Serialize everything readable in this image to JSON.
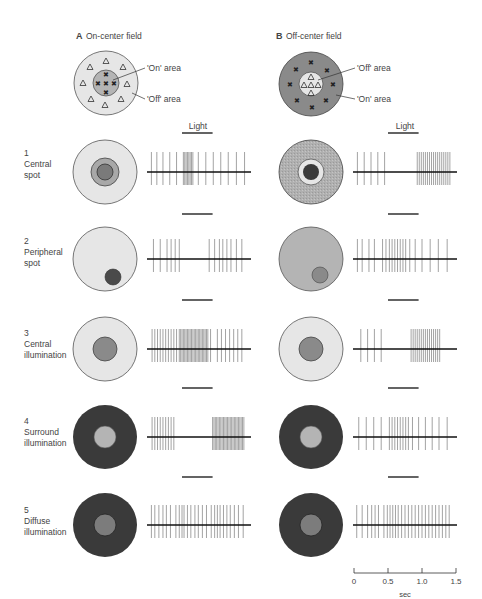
{
  "panels": {
    "A": {
      "letter": "A",
      "title": "On-center field",
      "center_label": "'On' area",
      "surround_label": "'Off' area",
      "center_symbol": "x",
      "surround_symbol": "triangle"
    },
    "B": {
      "letter": "B",
      "title": "Off-center field",
      "center_label": "'Off' area",
      "surround_label": "'On' area",
      "center_symbol": "triangle",
      "surround_symbol": "x"
    }
  },
  "light_label": "Light",
  "conditions": [
    {
      "num": "1",
      "line1": "Central",
      "line2": "spot"
    },
    {
      "num": "2",
      "line1": "Peripheral",
      "line2": "spot"
    },
    {
      "num": "3",
      "line1": "Central",
      "line2": "illumination"
    },
    {
      "num": "4",
      "line1": "Surround",
      "line2": "illumination"
    },
    {
      "num": "5",
      "line1": "Diffuse",
      "line2": "illumination"
    }
  ],
  "time_axis": {
    "ticks": [
      "0",
      "0.5",
      "1.0",
      "1.5"
    ],
    "label": "sec"
  },
  "colors": {
    "light_gray": "#e6e6e6",
    "mid_gray": "#b4b4b4",
    "dark_gray": "#8a8a8a",
    "dark": "#3a3a3a",
    "spot_dark": "#4a4a4a",
    "outline": "#555555",
    "spike": "#8c8c8c",
    "baseline": "#111111"
  },
  "spike_trains": {
    "A": [
      [
        0.05,
        0.13,
        0.22,
        0.32,
        0.42,
        0.52,
        0.54,
        0.56,
        0.58,
        0.6,
        0.62,
        0.64,
        0.66,
        0.74,
        0.85,
        0.96,
        1.07,
        1.18,
        1.3,
        1.42
      ],
      [
        0.08,
        0.18,
        0.28,
        0.34,
        0.4,
        0.46,
        0.9,
        0.98,
        1.05,
        1.1,
        1.16,
        1.22,
        1.3,
        1.38
      ],
      [
        0.06,
        0.1,
        0.14,
        0.18,
        0.22,
        0.26,
        0.3,
        0.34,
        0.38,
        0.42,
        0.46,
        0.48,
        0.5,
        0.52,
        0.54,
        0.56,
        0.58,
        0.6,
        0.62,
        0.64,
        0.66,
        0.68,
        0.7,
        0.72,
        0.74,
        0.76,
        0.78,
        0.8,
        0.82,
        0.84,
        0.86,
        0.88,
        0.92,
        1.02,
        1.08,
        1.14,
        1.2,
        1.26,
        1.32,
        1.38
      ],
      [
        0.06,
        0.1,
        0.14,
        0.18,
        0.22,
        0.26,
        0.3,
        0.34,
        0.38,
        0.95,
        0.97,
        0.99,
        1.01,
        1.03,
        1.05,
        1.07,
        1.09,
        1.11,
        1.13,
        1.15,
        1.17,
        1.19,
        1.21,
        1.23,
        1.25,
        1.27,
        1.29,
        1.31,
        1.33,
        1.35,
        1.37,
        1.39,
        1.41
      ],
      [
        0.05,
        0.1,
        0.16,
        0.22,
        0.27,
        0.33,
        0.41,
        0.46,
        0.5,
        0.53,
        0.58,
        0.63,
        0.69,
        0.74,
        0.8,
        0.86,
        0.93,
        0.98,
        1.02,
        1.06,
        1.11,
        1.16,
        1.21,
        1.27,
        1.33,
        1.4
      ]
    ],
    "B": [
      [
        0.05,
        0.15,
        0.25,
        0.35,
        0.45,
        0.93,
        0.96,
        0.99,
        1.02,
        1.05,
        1.08,
        1.11,
        1.14,
        1.17,
        1.2,
        1.23,
        1.26,
        1.29,
        1.32,
        1.35,
        1.38,
        1.41
      ],
      [
        0.05,
        0.12,
        0.22,
        0.3,
        0.42,
        0.47,
        0.52,
        0.56,
        0.6,
        0.64,
        0.68,
        0.72,
        0.76,
        0.82,
        0.9,
        1.0,
        1.12,
        1.24,
        1.37
      ],
      [
        0.1,
        0.2,
        0.3,
        0.4,
        0.84,
        0.87,
        0.9,
        0.93,
        0.96,
        0.99,
        1.02,
        1.05,
        1.08,
        1.11,
        1.14,
        1.17,
        1.2,
        1.23,
        1.26
      ],
      [
        0.07,
        0.18,
        0.29,
        0.4,
        0.52,
        0.56,
        0.6,
        0.64,
        0.68,
        0.72,
        0.76,
        0.8,
        0.86,
        0.95,
        1.05,
        1.15,
        1.25,
        1.37
      ],
      [
        0.04,
        0.12,
        0.2,
        0.26,
        0.31,
        0.36,
        0.44,
        0.49,
        0.53,
        0.57,
        0.61,
        0.65,
        0.7,
        0.75,
        0.8,
        0.85,
        0.9,
        0.95,
        1.0,
        1.05,
        1.1,
        1.15,
        1.2,
        1.25,
        1.3,
        1.35,
        1.4
      ]
    ]
  },
  "stimulus_window_sec": [
    0.5,
    0.95
  ]
}
